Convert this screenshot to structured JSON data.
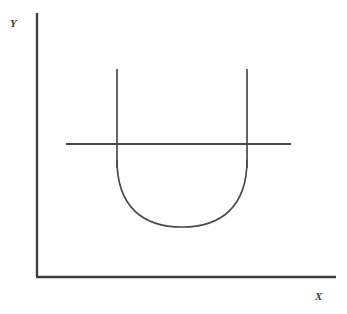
{
  "figure": {
    "kind": "line-diagram",
    "background_color": "#ffffff",
    "stroke_color": "#4a4a4a",
    "axis_color": "#3f3f3f"
  },
  "axes": {
    "y_label": "Y",
    "x_label": "X",
    "origin": {
      "x": 37,
      "y": 277
    },
    "y_axis_top": {
      "x": 37,
      "y": 13
    },
    "x_axis_right": {
      "x": 336,
      "y": 277
    },
    "axis_line_width": 2.4
  },
  "chart_data": {
    "type": "line",
    "title": "",
    "xlabel": "X",
    "ylabel": "Y",
    "grid": false,
    "legend": "none",
    "axis_origin_px": [
      37,
      277
    ],
    "xlim_px": [
      37,
      336
    ],
    "ylim_px": [
      277,
      13
    ],
    "series": [
      {
        "name": "u-curve",
        "description": "U-shaped (parabolic) curve opening upward, drawn between the two vertical branch lines",
        "shape": "parabola",
        "vertex_px": [
          182,
          227
        ],
        "left_endpoint_px": [
          117,
          160
        ],
        "right_endpoint_px": [
          247,
          160
        ],
        "x": [
          117,
          130,
          145,
          160,
          175,
          182,
          190,
          205,
          220,
          235,
          247
        ],
        "y": [
          160,
          186,
          206,
          219,
          226,
          227,
          226,
          219,
          206,
          186,
          160
        ]
      },
      {
        "name": "left-vertical-branch",
        "description": "Vertical line rising from the left side of the U curve",
        "shape": "vertical-segment",
        "x": [
          117,
          117
        ],
        "y": [
          69,
          168
        ]
      },
      {
        "name": "right-vertical-branch",
        "description": "Vertical line rising from the right side of the U curve",
        "shape": "vertical-segment",
        "x": [
          247,
          247
        ],
        "y": [
          69,
          168
        ]
      },
      {
        "name": "horizontal-cut-line",
        "description": "Horizontal line crossing both vertical branches",
        "shape": "horizontal-segment",
        "x": [
          66,
          291
        ],
        "y": [
          144,
          144
        ],
        "intersections_px": [
          [
            117,
            144
          ],
          [
            247,
            144
          ]
        ]
      }
    ]
  }
}
